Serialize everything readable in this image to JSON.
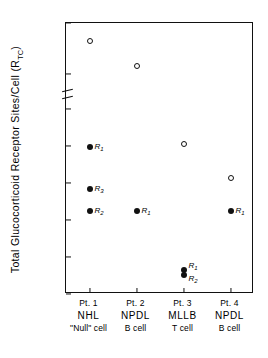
{
  "chart_data": {
    "type": "scatter",
    "title": "",
    "xlabel": "",
    "ylabel": "Total Glucocorticoid Receptor Sites/Cell (R",
    "ylabel_sub": "TC",
    "ylabel_tail": ")",
    "grid": false,
    "legend": "none",
    "axis_break": {
      "present": true,
      "between": [
        16000,
        10000
      ]
    },
    "ylim_lower": [
      0,
      10000
    ],
    "ylim_upper": [
      10000,
      18000
    ],
    "yticks": [
      "18,000",
      "16,000",
      "10,000",
      "8,000",
      "6,000",
      "4,000",
      "2,000",
      "0"
    ],
    "ytick_values": [
      18000,
      16000,
      10000,
      8000,
      6000,
      4000,
      2000,
      0
    ],
    "categories": [
      {
        "patient": "Pt. 1",
        "diagnosis": "NHL",
        "celltype": "\"Null\" cell"
      },
      {
        "patient": "Pt. 2",
        "diagnosis": "NPDL",
        "celltype": "B cell"
      },
      {
        "patient": "Pt. 3",
        "diagnosis": "MLLB",
        "celltype": "T cell"
      },
      {
        "patient": "Pt. 4",
        "diagnosis": "NPDL",
        "celltype": "B cell"
      }
    ],
    "series": [
      {
        "name": "open",
        "marker": "open-circle",
        "points": [
          {
            "category": 0,
            "value": 17300,
            "label": ""
          },
          {
            "category": 1,
            "value": 16300,
            "label": ""
          },
          {
            "category": 2,
            "value": 8100,
            "label": ""
          },
          {
            "category": 3,
            "value": 6250,
            "label": ""
          }
        ]
      },
      {
        "name": "filled",
        "marker": "filled-circle",
        "points": [
          {
            "category": 0,
            "value": 7950,
            "label": "R",
            "sub": "1"
          },
          {
            "category": 0,
            "value": 5700,
            "label": "R",
            "sub": "3"
          },
          {
            "category": 0,
            "value": 4500,
            "label": "R",
            "sub": "2"
          },
          {
            "category": 1,
            "value": 4500,
            "label": "R",
            "sub": "1"
          },
          {
            "category": 2,
            "value": 1300,
            "label": "R",
            "sub": "1"
          },
          {
            "category": 2,
            "value": 1050,
            "label": "R",
            "sub": "2"
          },
          {
            "category": 3,
            "value": 4500,
            "label": "R",
            "sub": "1"
          }
        ]
      }
    ]
  }
}
